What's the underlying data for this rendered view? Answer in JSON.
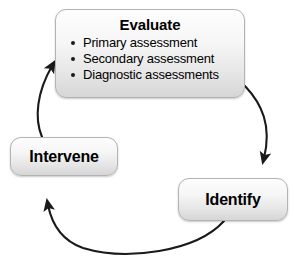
{
  "diagram": {
    "background_color": "#ffffff",
    "stroke_color": "#1a1a1a",
    "node_border_color": "#b3b3b3",
    "node_fill_top": "#fdfdfd",
    "node_fill_bottom": "#d6d6d6",
    "nodes": {
      "evaluate": {
        "label": "Evaluate",
        "bullets": [
          "Primary assessment",
          "Secondary assessment",
          "Diagnostic assessments"
        ]
      },
      "identify": {
        "label": "Identify"
      },
      "intervene": {
        "label": "Intervene"
      }
    },
    "arrows": [
      {
        "name": "evaluate-to-identify",
        "from": "evaluate",
        "to": "identify"
      },
      {
        "name": "identify-to-intervene",
        "from": "identify",
        "to": "intervene"
      },
      {
        "name": "intervene-to-evaluate",
        "from": "intervene",
        "to": "evaluate"
      }
    ]
  }
}
